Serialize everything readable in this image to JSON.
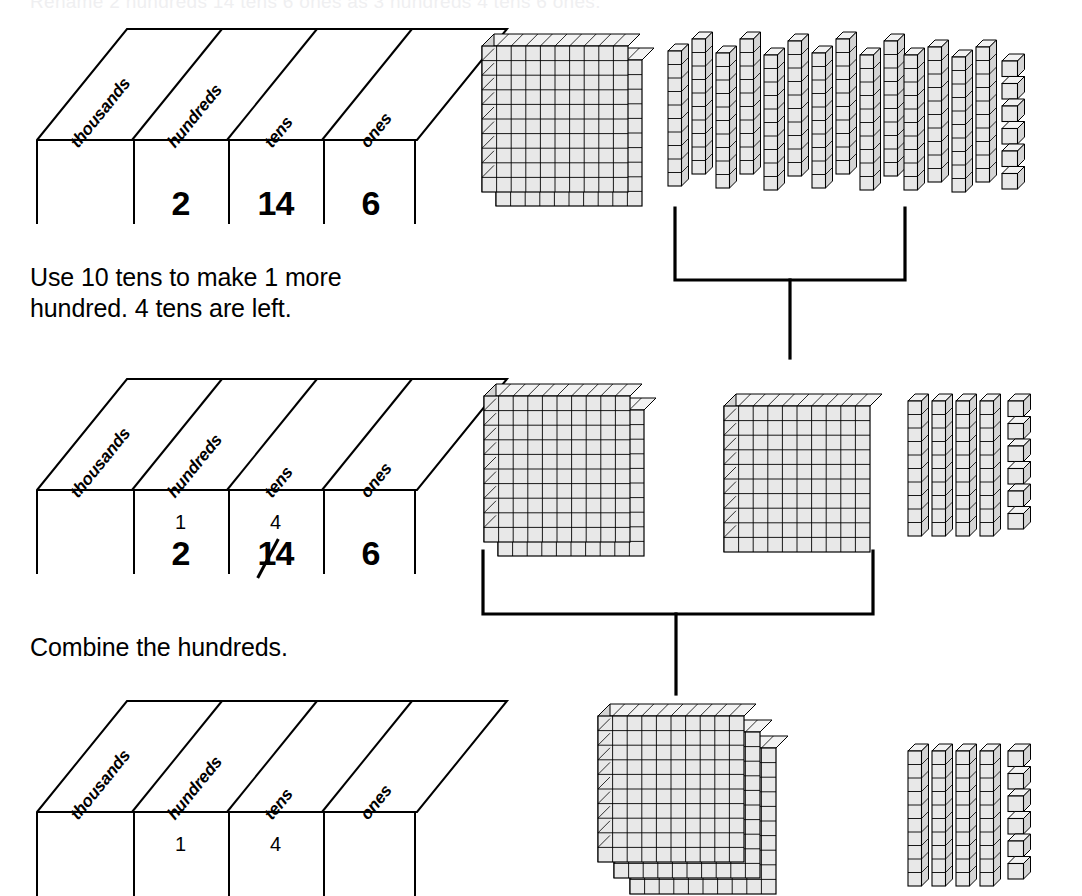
{
  "top_cut_text": "Rename 2 hundreds 14 tens 6 ones as 3 hundreds 4 tens 6 ones.",
  "place_value_headers": [
    "thousands",
    "hundreds",
    "tens",
    "ones"
  ],
  "charts": [
    {
      "id": "chart-initial",
      "headers": [
        "thousands",
        "hundreds",
        "tens",
        "ones"
      ],
      "cells": {
        "thousands": "",
        "hundreds": "2",
        "tens": "14",
        "ones": "6"
      },
      "carries": {
        "hundreds": "",
        "tens": ""
      },
      "struck": []
    },
    {
      "id": "chart-regrouped",
      "headers": [
        "thousands",
        "hundreds",
        "tens",
        "ones"
      ],
      "cells": {
        "thousands": "",
        "hundreds": "2",
        "tens": "14",
        "ones": "6"
      },
      "carries": {
        "hundreds": "1",
        "tens": "4"
      },
      "struck": [
        "tens"
      ]
    },
    {
      "id": "chart-final",
      "headers": [
        "thousands",
        "hundreds",
        "tens",
        "ones"
      ],
      "cells": {
        "thousands": "",
        "hundreds": "",
        "tens": "",
        "ones": ""
      },
      "carries": {
        "hundreds": "1",
        "tens": "4"
      },
      "struck": []
    }
  ],
  "instructions": [
    {
      "id": "step-1",
      "line1": "Use 10 tens to make 1 more",
      "line2": "hundred. 4 tens are left."
    },
    {
      "id": "step-2",
      "line1": "Combine the hundreds.",
      "line2": ""
    }
  ],
  "block_rows": [
    {
      "id": "row-initial",
      "hundreds_flats": 2,
      "tens_group_regroup": 10,
      "tens_group_remainder": 4,
      "ones_cubes": 6
    },
    {
      "id": "row-middle",
      "hundreds_flats": 2,
      "hundreds_new_flat": 1,
      "tens_group_remainder": 4,
      "ones_cubes": 6
    },
    {
      "id": "row-final",
      "hundreds_flats": 3,
      "tens_group_remainder": 4,
      "ones_cubes": 6
    }
  ],
  "colors": {
    "ink": "#000000",
    "block_face": "#e8e8e8",
    "block_top": "#f2f2f2",
    "block_side": "#d4d4d4",
    "paper": "#ffffff"
  }
}
